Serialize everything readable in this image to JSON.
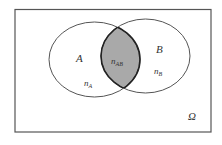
{
  "diagram": {
    "type": "venn",
    "universe": {
      "label": "Ω"
    },
    "sets": [
      {
        "name": "A",
        "count_label": "n",
        "count_sub": "A"
      },
      {
        "name": "B",
        "count_label": "n",
        "count_sub": "B"
      }
    ],
    "intersection": {
      "count_label": "n",
      "count_sub": "AB"
    },
    "colors": {
      "border": "#555555",
      "intersection_fill": "#a9a9a9",
      "intersection_stroke": "#222222",
      "background": "#ffffff"
    }
  }
}
